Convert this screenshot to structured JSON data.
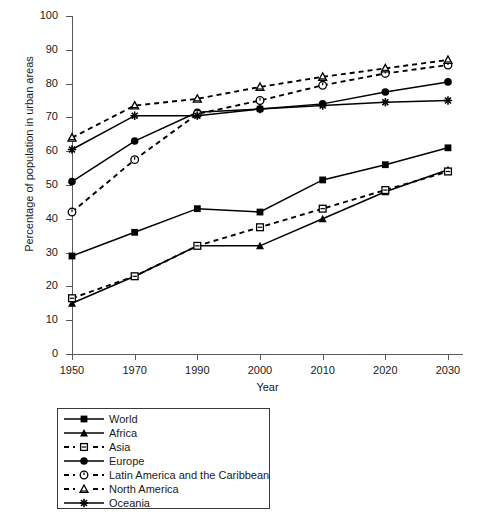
{
  "chart_data": {
    "type": "line",
    "title": "",
    "xlabel": "Year",
    "ylabel": "Percentage of population in urban areas",
    "categories": [
      "1950",
      "1970",
      "1990",
      "2000",
      "2010",
      "2020",
      "2030"
    ],
    "ylim": [
      0,
      100
    ],
    "ytick_labels": [
      "0",
      "10",
      "20",
      "30",
      "40",
      "50",
      "60",
      "70",
      "80",
      "90",
      "100"
    ],
    "yticks": [
      0,
      10,
      20,
      30,
      40,
      50,
      60,
      70,
      80,
      90,
      100
    ],
    "grid": false,
    "legend_position": "below-left",
    "series": [
      {
        "name": "World",
        "marker": "filled-square",
        "linestyle": "solid",
        "color": "#000000",
        "values": [
          29,
          36,
          43,
          42,
          51.5,
          56,
          61
        ]
      },
      {
        "name": "Africa",
        "marker": "filled-triangle",
        "linestyle": "solid",
        "color": "#000000",
        "values": [
          15,
          23,
          32,
          32,
          40,
          48,
          54.5
        ]
      },
      {
        "name": "Asia",
        "marker": "open-square",
        "linestyle": "dashed",
        "color": "#000000",
        "values": [
          16.5,
          23,
          32,
          37.5,
          43,
          48.5,
          54
        ]
      },
      {
        "name": "Europe",
        "marker": "filled-circle",
        "linestyle": "solid",
        "color": "#000000",
        "values": [
          51,
          63,
          71.5,
          72.5,
          74,
          77.5,
          80.5
        ]
      },
      {
        "name": "Latin America and the Caribbean",
        "marker": "open-circle",
        "linestyle": "dashed",
        "color": "#000000",
        "values": [
          42,
          57.5,
          71,
          75,
          79.5,
          83,
          85.5
        ]
      },
      {
        "name": "North America",
        "marker": "open-triangle",
        "linestyle": "dashed",
        "color": "#000000",
        "values": [
          64,
          73.5,
          75.5,
          79,
          82,
          84.5,
          87
        ]
      },
      {
        "name": "Oceania",
        "marker": "asterisk",
        "linestyle": "solid",
        "color": "#000000",
        "values": [
          60.5,
          70.5,
          70.5,
          72.5,
          73.5,
          74.5,
          75
        ]
      }
    ]
  },
  "legend": {
    "entries": [
      {
        "label": "World"
      },
      {
        "label": "Africa"
      },
      {
        "label": "Asia"
      },
      {
        "label": "Europe"
      },
      {
        "label": "Latin America and the Caribbean"
      },
      {
        "label": "North America"
      },
      {
        "label": "Oceania"
      }
    ]
  }
}
